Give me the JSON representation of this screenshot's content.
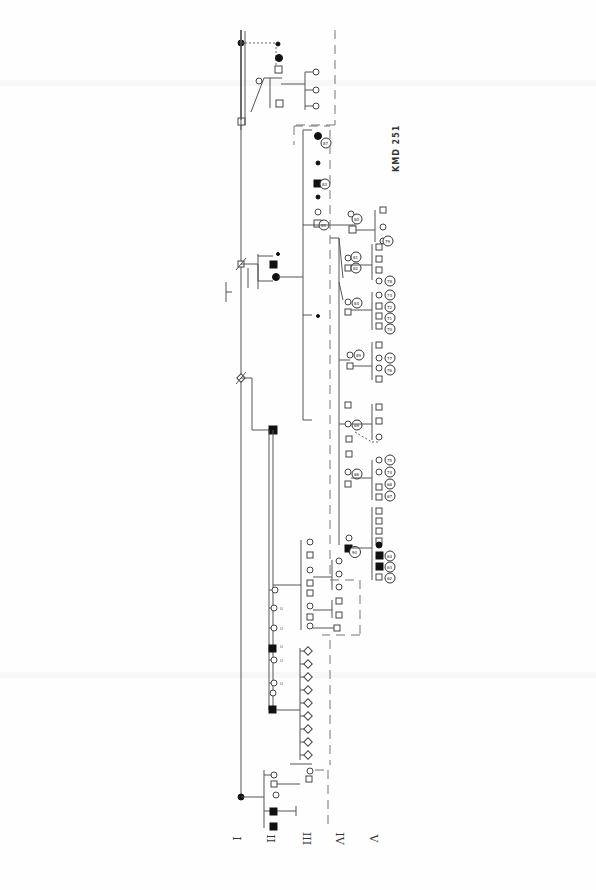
{
  "document": {
    "type": "pedigree chart (rotated 90°)",
    "label": "KMD 251",
    "generations": [
      "I",
      "II",
      "III",
      "IV",
      "V"
    ]
  },
  "colors": {
    "line": "#555555",
    "affected": "#111111",
    "unaffected": "#ffffff",
    "dashed_boundary": "#777777"
  },
  "legend": {
    "filled_square": "affected male",
    "filled_circle": "affected female",
    "open_square": "unaffected male",
    "open_circle": "unaffected female",
    "diamond": "sex unspecified",
    "slash": "deceased",
    "ringed_number": "individual count/code",
    "U": "unknown status"
  },
  "nodes": [
    {
      "id": "I-1",
      "shape": "circle",
      "affected": true,
      "x": 241,
      "y": 797
    },
    {
      "id": "I-2",
      "shape": "square",
      "affected": false,
      "x": 241,
      "y": 378,
      "slash": true
    },
    {
      "id": "I-3",
      "shape": "square",
      "affected": false,
      "x": 241,
      "y": 264,
      "slash": true
    },
    {
      "id": "I-4",
      "shape": "circle",
      "affected": true,
      "x": 241,
      "y": 43
    },
    {
      "id": "II-a",
      "shape": "circle",
      "affected": false,
      "x": 273,
      "y": 775
    },
    {
      "id": "II-b",
      "shape": "square",
      "affected": true,
      "x": 273,
      "y": 811
    },
    {
      "id": "II-c",
      "shape": "square",
      "affected": true,
      "x": 273,
      "y": 826
    },
    {
      "id": "II-d",
      "shape": "square",
      "affected": true,
      "x": 273,
      "y": 430
    },
    {
      "id": "II-e",
      "shape": "square",
      "affected": true,
      "x": 273,
      "y": 237
    },
    {
      "id": "II-f",
      "shape": "circle",
      "affected": true,
      "x": 273,
      "y": 281
    },
    {
      "id": "II-g",
      "shape": "square",
      "affected": false,
      "x": 273,
      "y": 125
    }
  ],
  "ringed_labels": [
    "62",
    "63",
    "64",
    "65",
    "66",
    "67",
    "68",
    "69",
    "70",
    "71",
    "72",
    "73",
    "74",
    "75",
    "76",
    "77",
    "78",
    "79",
    "80",
    "81",
    "82",
    "83",
    "84",
    "85",
    "86",
    "87",
    "88"
  ],
  "annotations": {
    "unknown_marker": "U"
  }
}
